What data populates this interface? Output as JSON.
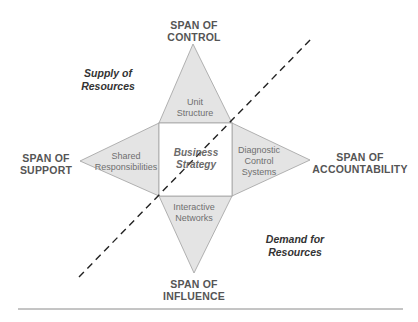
{
  "diagram": {
    "spans": {
      "top": [
        "SPAN OF",
        "CONTROL"
      ],
      "left": [
        "SPAN OF",
        "SUPPORT"
      ],
      "right": [
        "SPAN OF",
        "ACCOUNTABILITY"
      ],
      "bottom": [
        "SPAN OF",
        "INFLUENCE"
      ]
    },
    "levers": {
      "top": [
        "Unit",
        "Structure"
      ],
      "left": [
        "Shared",
        "Responsibilities"
      ],
      "right": [
        "Diagnostic",
        "Control",
        "Systems"
      ],
      "bottom": [
        "Interactive",
        "Networks"
      ]
    },
    "center": [
      "Business",
      "Strategy"
    ],
    "regions": {
      "supply": [
        "Supply of",
        "Resources"
      ],
      "demand": [
        "Demand for",
        "Resources"
      ]
    },
    "colors": {
      "fill": "#e4e4e4",
      "stroke": "#9a9a9a",
      "dash": "#222222",
      "rule": "#888888"
    }
  }
}
